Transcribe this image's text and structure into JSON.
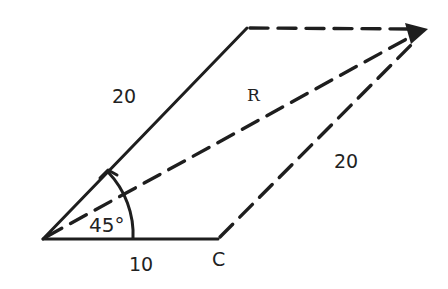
{
  "diagram": {
    "type": "vector-parallelogram",
    "stroke_color": "#1e1e1e",
    "labels": {
      "left_side": "20",
      "resultant": "R",
      "right_side": "20",
      "angle": "45°",
      "bottom_side": "10",
      "bottom_point": "C"
    },
    "vectors": [
      {
        "name": "side-a",
        "magnitude": "20",
        "angle_deg": 45,
        "style": "solid"
      },
      {
        "name": "side-b",
        "magnitude": "10",
        "angle_deg": 0,
        "style": "solid"
      },
      {
        "name": "resultant",
        "label": "R",
        "style": "dashed"
      }
    ]
  }
}
